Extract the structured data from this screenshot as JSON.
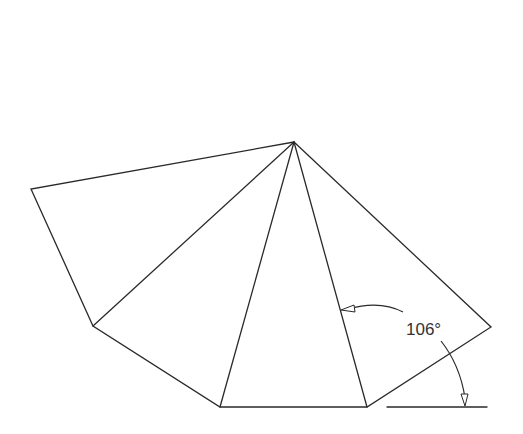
{
  "diagram": {
    "type": "polygon-fan",
    "stroke_color": "#2a2a2a",
    "vertices": {
      "apex": [
        294,
        142
      ],
      "left": [
        31,
        189
      ],
      "lower_left": [
        93,
        326
      ],
      "bottom_left": [
        220,
        407
      ],
      "bottom_right": [
        367,
        407
      ],
      "right": [
        491,
        327
      ]
    },
    "reference_line": {
      "from": [
        387,
        407
      ],
      "to": [
        487,
        407
      ]
    },
    "angle_annotation": {
      "label": "106°",
      "position": [
        406,
        335
      ]
    }
  }
}
